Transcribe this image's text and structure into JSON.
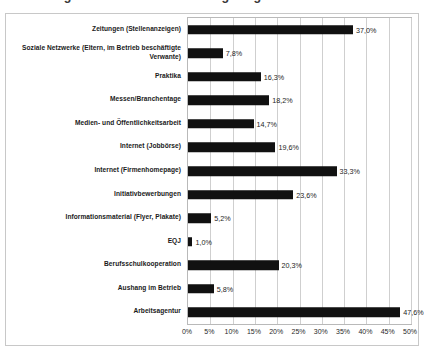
{
  "title_remnant": "Abbildung 4:  Genutzte Rekrutierungswege",
  "chart_data": {
    "type": "bar",
    "orientation": "horizontal",
    "title": "",
    "xlabel": "",
    "ylabel": "",
    "xlim": [
      0,
      50
    ],
    "grid": true,
    "legend": "none",
    "value_suffix": "%",
    "decimal_separator": ",",
    "bar_color": "#111111",
    "categories": [
      "Zeitungen (Stellenanzeigen)",
      "Soziale Netzwerke (Eltern, im Betrieb beschäftigte Verwante)",
      "Praktika",
      "Messen/Branchentage",
      "Medien- und Öffentlichkeitsarbeit",
      "Internet (Jobbörse)",
      "Internet (Firmenhomepage)",
      "Initiativbewerbungen",
      "Informationsmaterial (Flyer, Plakate)",
      "EQJ",
      "Berufsschulkooperation",
      "Aushang im Betrieb",
      "Arbeitsagentur"
    ],
    "values": [
      37.0,
      7.8,
      16.3,
      18.2,
      14.7,
      19.6,
      33.3,
      23.6,
      5.2,
      1.0,
      20.3,
      5.8,
      47.6
    ],
    "value_labels": [
      "37,0%",
      "7,8%",
      "16,3%",
      "18,2%",
      "14,7%",
      "19,6%",
      "33,3%",
      "23,6%",
      "5,2%",
      "1,0%",
      "20,3%",
      "5,8%",
      "47,6%"
    ],
    "xticks": [
      0,
      5,
      10,
      15,
      20,
      25,
      30,
      35,
      40,
      45,
      50
    ],
    "xticklabels": [
      "0%",
      "5%",
      "10%",
      "15%",
      "20%",
      "25%",
      "30%",
      "35%",
      "40%",
      "45%",
      "50%"
    ]
  }
}
